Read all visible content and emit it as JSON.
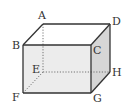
{
  "diagram": {
    "type": "cuboid",
    "colors": {
      "edge": "#333333",
      "hidden_edge": "#666666",
      "front_face": "#ececec",
      "right_face": "#d6d6d6",
      "top_face": "#ffffff",
      "label": "#333333"
    },
    "vertices": {
      "A": {
        "label": "A",
        "x": 43,
        "y": 24
      },
      "B": {
        "label": "B",
        "x": 23,
        "y": 45
      },
      "C": {
        "label": "C",
        "x": 91,
        "y": 45
      },
      "D": {
        "label": "D",
        "x": 110,
        "y": 24
      },
      "E": {
        "label": "E",
        "x": 43,
        "y": 72
      },
      "F": {
        "label": "F",
        "x": 23,
        "y": 93
      },
      "G": {
        "label": "G",
        "x": 91,
        "y": 93
      },
      "H": {
        "label": "H",
        "x": 110,
        "y": 72
      }
    },
    "visible_edges": [
      "AB",
      "AD",
      "BC",
      "CD",
      "BF",
      "CG",
      "DH",
      "FG",
      "GH"
    ],
    "hidden_edges": [
      "AE",
      "EF",
      "EH"
    ]
  }
}
